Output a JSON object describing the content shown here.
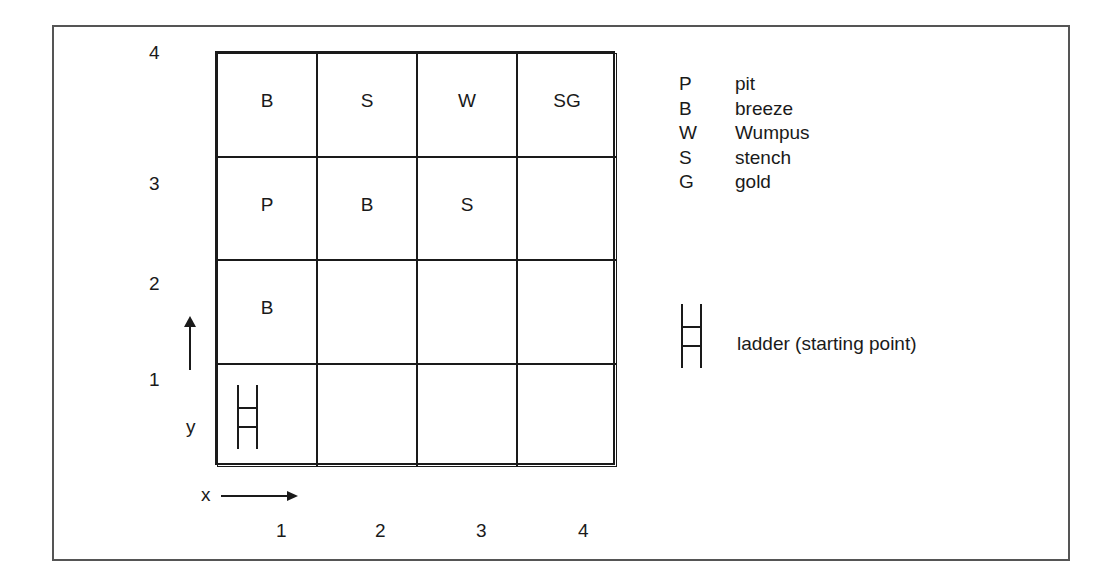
{
  "diagram": {
    "y_labels": [
      "4",
      "3",
      "2",
      "1"
    ],
    "x_labels": [
      "1",
      "2",
      "3",
      "4"
    ],
    "axis": {
      "x_name": "x",
      "y_name": "y"
    },
    "rows": [
      [
        "B",
        "S",
        "W",
        "SG"
      ],
      [
        "P",
        "B",
        "S",
        ""
      ],
      [
        "B",
        "",
        "",
        ""
      ],
      [
        "",
        "",
        "",
        ""
      ]
    ],
    "start_cell": {
      "x": 1,
      "y": 1,
      "icon": "ladder-icon"
    }
  },
  "legend": {
    "items": [
      {
        "key": "P",
        "label": "pit"
      },
      {
        "key": "B",
        "label": "breeze"
      },
      {
        "key": "W",
        "label": "Wumpus"
      },
      {
        "key": "S",
        "label": "stench"
      },
      {
        "key": "G",
        "label": "gold"
      }
    ],
    "ladder_label": "ladder (starting point)"
  }
}
